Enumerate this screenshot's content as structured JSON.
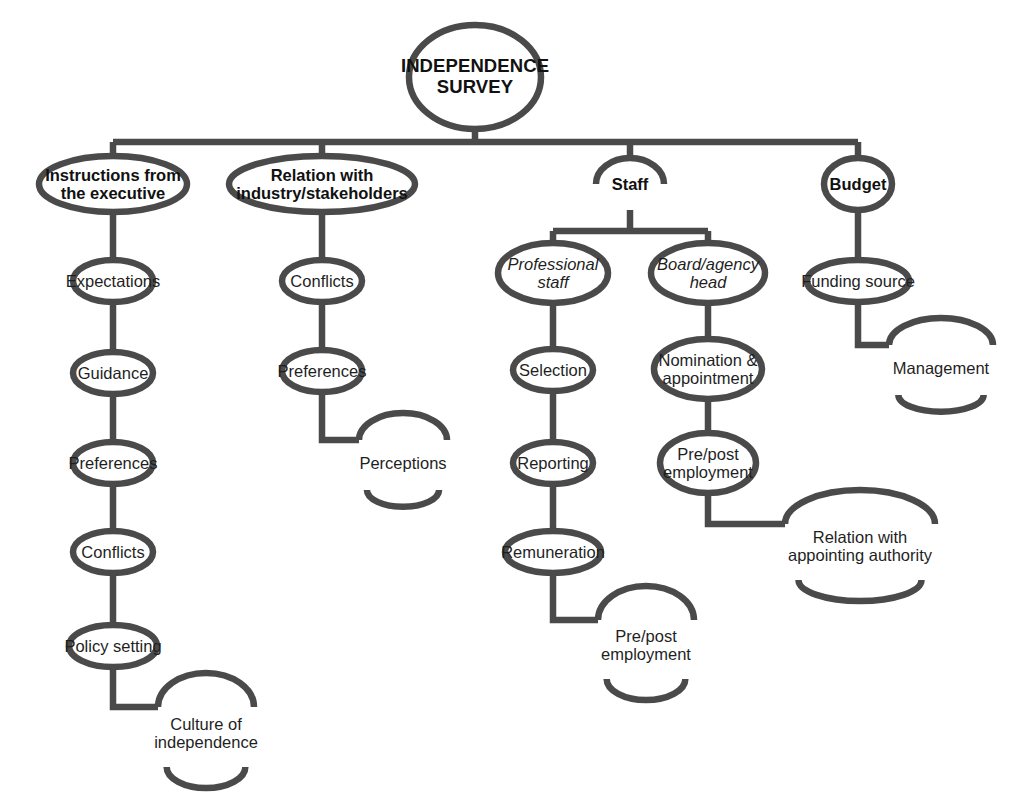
{
  "diagram": {
    "title": "INDEPENDENCE SURVEY",
    "type": "tree",
    "stroke_color": "#4a4a4a",
    "text_color": "#1f1f1f",
    "background_color": "#ffffff",
    "root": {
      "id": "root",
      "label": "INDEPENDENCE\nSURVEY",
      "style": "root",
      "shape": "oval",
      "x": 475,
      "y": 77,
      "rx": 66,
      "ry": 52
    },
    "nodes": [
      {
        "id": "instructions",
        "label": "Instructions from\nthe executive",
        "style": "branch",
        "shape": "arc-both",
        "x": 113,
        "y": 184,
        "rx": 74,
        "ry": 28
      },
      {
        "id": "expectations",
        "label": "Expectations",
        "style": "leaf",
        "shape": "arc-both",
        "x": 113,
        "y": 281,
        "rx": 40,
        "ry": 21
      },
      {
        "id": "guidance",
        "label": "Guidance",
        "style": "leaf",
        "shape": "arc-both",
        "x": 113,
        "y": 373,
        "rx": 40,
        "ry": 21
      },
      {
        "id": "preferences-1",
        "label": "Preferences",
        "style": "leaf",
        "shape": "arc-both",
        "x": 113,
        "y": 463,
        "rx": 40,
        "ry": 21
      },
      {
        "id": "conflicts-1",
        "label": "Conflicts",
        "style": "leaf",
        "shape": "arc-both",
        "x": 113,
        "y": 552,
        "rx": 40,
        "ry": 21
      },
      {
        "id": "policy-setting",
        "label": "Policy setting",
        "style": "leaf",
        "shape": "arc-both",
        "x": 113,
        "y": 646,
        "rx": 44,
        "ry": 21
      },
      {
        "id": "culture",
        "label": "Culture of\nindependence",
        "style": "leaf",
        "shape": "oval",
        "x": 206,
        "y": 733,
        "rx": 48,
        "ry": 34
      },
      {
        "id": "relation-industry",
        "label": "Relation with\nindustry/stakeholders",
        "style": "branch",
        "shape": "arc-both",
        "x": 322,
        "y": 184,
        "rx": 93,
        "ry": 28
      },
      {
        "id": "conflicts-2",
        "label": "Conflicts",
        "style": "leaf",
        "shape": "arc-both",
        "x": 322,
        "y": 281,
        "rx": 40,
        "ry": 21
      },
      {
        "id": "preferences-2",
        "label": "Preferences",
        "style": "leaf",
        "shape": "arc-both",
        "x": 322,
        "y": 371,
        "rx": 40,
        "ry": 21
      },
      {
        "id": "perceptions",
        "label": "Perceptions",
        "style": "leaf",
        "shape": "oval",
        "x": 403,
        "y": 463,
        "rx": 44,
        "ry": 27
      },
      {
        "id": "staff",
        "label": "Staff",
        "style": "branch",
        "shape": "arc-both",
        "x": 630,
        "y": 184,
        "rx": 34,
        "ry": 26
      },
      {
        "id": "professional-staff",
        "label": "Professional\nstaff",
        "style": "sub",
        "shape": "arc-both",
        "x": 553,
        "y": 273,
        "rx": 55,
        "ry": 30
      },
      {
        "id": "selection",
        "label": "Selection",
        "style": "leaf",
        "shape": "arc-both",
        "x": 553,
        "y": 370,
        "rx": 40,
        "ry": 21
      },
      {
        "id": "reporting",
        "label": "Reporting",
        "style": "leaf",
        "shape": "arc-both",
        "x": 553,
        "y": 463,
        "rx": 40,
        "ry": 21
      },
      {
        "id": "remuneration",
        "label": "Remuneration",
        "style": "leaf",
        "shape": "arc-both",
        "x": 553,
        "y": 552,
        "rx": 48,
        "ry": 21
      },
      {
        "id": "prepost-1",
        "label": "Pre/post\nemployment",
        "style": "leaf",
        "shape": "oval",
        "x": 646,
        "y": 645,
        "rx": 48,
        "ry": 34
      },
      {
        "id": "board-agency-head",
        "label": "Board/agency\nhead",
        "style": "sub",
        "shape": "arc-both",
        "x": 708,
        "y": 273,
        "rx": 57,
        "ry": 30
      },
      {
        "id": "nomination",
        "label": "Nomination &\nappointment",
        "style": "leaf",
        "shape": "arc-both",
        "x": 708,
        "y": 369,
        "rx": 54,
        "ry": 30
      },
      {
        "id": "prepost-2",
        "label": "Pre/post\nemployment",
        "style": "leaf",
        "shape": "arc-both",
        "x": 708,
        "y": 463,
        "rx": 48,
        "ry": 30
      },
      {
        "id": "relation-appointing",
        "label": "Relation with\nappointing authority",
        "style": "leaf",
        "shape": "oval",
        "x": 860,
        "y": 546,
        "rx": 75,
        "ry": 34
      },
      {
        "id": "budget",
        "label": "Budget",
        "style": "branch",
        "shape": "arc-both",
        "x": 858,
        "y": 184,
        "rx": 34,
        "ry": 26
      },
      {
        "id": "funding-source",
        "label": "Funding source",
        "style": "leaf",
        "shape": "arc-both",
        "x": 858,
        "y": 281,
        "rx": 51,
        "ry": 21
      },
      {
        "id": "management",
        "label": "Management",
        "style": "oval",
        "shape": "oval",
        "x": 941,
        "y": 368,
        "rx": 52,
        "ry": 27
      }
    ],
    "connectors": {
      "vertical_chains": [
        [
          "instructions",
          "expectations"
        ],
        [
          "expectations",
          "guidance"
        ],
        [
          "guidance",
          "preferences-1"
        ],
        [
          "preferences-1",
          "conflicts-1"
        ],
        [
          "conflicts-1",
          "policy-setting"
        ],
        [
          "relation-industry",
          "conflicts-2"
        ],
        [
          "conflicts-2",
          "preferences-2"
        ],
        [
          "professional-staff",
          "selection"
        ],
        [
          "selection",
          "reporting"
        ],
        [
          "reporting",
          "remuneration"
        ],
        [
          "board-agency-head",
          "nomination"
        ],
        [
          "nomination",
          "prepost-2"
        ],
        [
          "budget",
          "funding-source"
        ]
      ],
      "elbows": [
        {
          "from": "policy-setting",
          "to": "culture",
          "drop_y": 707
        },
        {
          "from": "preferences-2",
          "to": "perceptions",
          "drop_y": 440
        },
        {
          "from": "remuneration",
          "to": "prepost-1",
          "drop_y": 620
        },
        {
          "from": "prepost-2",
          "to": "relation-appointing",
          "drop_y": 524
        },
        {
          "from": "funding-source",
          "to": "management",
          "drop_y": 345
        }
      ],
      "bus_bars": [
        {
          "id": "root-bus",
          "y": 142,
          "x1": 113,
          "x2": 858,
          "from_x": 475,
          "from_y": 129,
          "children": [
            "instructions",
            "relation-industry",
            "staff",
            "budget"
          ]
        },
        {
          "id": "staff-bus",
          "y": 231,
          "x1": 553,
          "x2": 708,
          "from_x": 630,
          "from_y": 210,
          "children": [
            "professional-staff",
            "board-agency-head"
          ]
        }
      ]
    },
    "legend": {
      "root_branch_count": 4,
      "branches": [
        "Instructions from the executive",
        "Relation with industry/stakeholders",
        "Staff",
        "Budget"
      ]
    }
  }
}
